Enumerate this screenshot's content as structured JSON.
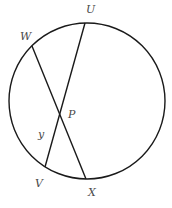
{
  "diagram": {
    "type": "circle-with-intersecting-chords",
    "stroke_color": "#1a1a1a",
    "label_color": "#4a4a4a",
    "circle": {
      "cx": 87,
      "cy": 101,
      "r": 78
    },
    "points": {
      "U": {
        "label": "U",
        "x": 85,
        "y": 23,
        "label_x": 86,
        "label_y": 13
      },
      "W": {
        "label": "W",
        "x": 32,
        "y": 46,
        "label_x": 20,
        "label_y": 40
      },
      "V": {
        "label": "V",
        "x": 45,
        "y": 167,
        "label_x": 35,
        "label_y": 187
      },
      "X": {
        "label": "X",
        "x": 86,
        "y": 179,
        "label_x": 88,
        "label_y": 196
      },
      "P": {
        "label": "P",
        "x": 60,
        "y": 114,
        "label_x": 68,
        "label_y": 118
      }
    },
    "chords": [
      {
        "name": "UV",
        "from": "U",
        "to": "V"
      },
      {
        "name": "WX",
        "from": "W",
        "to": "X"
      }
    ],
    "segment_labels": [
      {
        "text": "y",
        "segment": "PV",
        "x": 38,
        "y": 138
      }
    ]
  }
}
